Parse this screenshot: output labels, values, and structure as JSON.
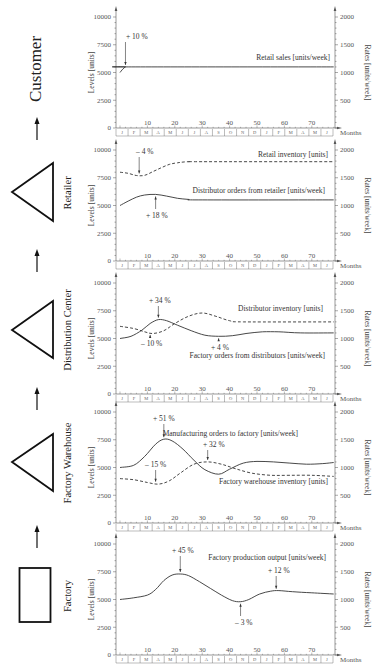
{
  "stages": [
    {
      "name": "Customer",
      "shape": "none"
    },
    {
      "name": "Retailer",
      "shape": "triangle"
    },
    {
      "name": "Distribution Center",
      "shape": "triangle"
    },
    {
      "name": "Factory Warehouse",
      "shape": "triangle"
    },
    {
      "name": "Factory",
      "shape": "rectangle"
    }
  ],
  "axes": {
    "left_title": "Levels  [units]",
    "right_title": "Rates  [units/week]",
    "x_title": "Months",
    "left_ticks": [
      0,
      2500,
      5000,
      7500,
      10000
    ],
    "right_ticks": [
      500,
      1000,
      1500,
      2000
    ],
    "x_ticks": [
      10,
      20,
      30,
      40,
      50,
      60,
      70
    ],
    "month_letters": [
      "J",
      "F",
      "M",
      "A",
      "M",
      "J",
      "J",
      "A",
      "S",
      "O",
      "N",
      "D",
      "J",
      "F",
      "M",
      "A",
      "M",
      "J"
    ]
  },
  "chart_data": [
    {
      "type": "line",
      "panel": "Customer",
      "xlabel": "Months",
      "ylabel_left": "Levels [units]",
      "ylabel_right": "Rates [units/week]",
      "ylim_left": [
        0,
        10000
      ],
      "ylim_right": [
        0,
        2000
      ],
      "xlim": [
        0,
        78
      ],
      "series": [
        {
          "name": "Retail sales [units/week]",
          "axis": "right",
          "style": "solid",
          "x": [
            0,
            1,
            2,
            3,
            78
          ],
          "values": [
            1000,
            1060,
            1100,
            1100,
            1100
          ]
        }
      ],
      "annotations": [
        {
          "text": "+ 10 %",
          "x": 2,
          "y_rate": 1100,
          "label_pos": [
            126,
            39
          ]
        }
      ],
      "label_positions": {
        "Retail sales [units/week]": [
          330,
          60
        ]
      }
    },
    {
      "type": "line",
      "panel": "Retailer",
      "ylim_left": [
        0,
        10000
      ],
      "ylim_right": [
        0,
        2000
      ],
      "xlim": [
        0,
        78
      ],
      "series": [
        {
          "name": "Retail inventory  [units]",
          "axis": "left",
          "style": "dashed",
          "x": [
            0,
            3,
            6,
            9,
            12,
            15,
            18,
            21,
            25,
            30,
            78
          ],
          "values": [
            8000,
            7900,
            7700,
            7720,
            8050,
            8400,
            8700,
            8850,
            8950,
            8950,
            8950
          ]
        },
        {
          "name": "Distributor orders from retailer [units/week]",
          "axis": "right",
          "style": "solid",
          "x": [
            0,
            3,
            6,
            9,
            13,
            17,
            21,
            25,
            30,
            78
          ],
          "values": [
            1000,
            1080,
            1150,
            1190,
            1200,
            1170,
            1130,
            1110,
            1100,
            1100
          ]
        }
      ],
      "annotations": [
        {
          "text": "– 4 %",
          "x": 7,
          "label_pos": [
            136,
            154
          ]
        },
        {
          "text": "+ 18 %",
          "x": 13,
          "label_pos": [
            146,
            218
          ]
        }
      ],
      "label_positions": {
        "Retail inventory  [units]": [
          328,
          157
        ],
        "Distributor orders from retailer [units/week]": [
          325,
          193
        ]
      }
    },
    {
      "type": "line",
      "panel": "Distribution Center",
      "ylim_left": [
        0,
        10000
      ],
      "ylim_right": [
        0,
        2000
      ],
      "xlim": [
        0,
        78
      ],
      "series": [
        {
          "name": "Distributor inventory  [units]",
          "axis": "left",
          "style": "dashed",
          "x": [
            0,
            5,
            9,
            12,
            16,
            20,
            25,
            30,
            35,
            40,
            45,
            78
          ],
          "values": [
            6100,
            5900,
            5600,
            5450,
            5700,
            6350,
            7000,
            7300,
            7000,
            6600,
            6500,
            6500
          ]
        },
        {
          "name": "Factory orders from distributors [units/week]",
          "axis": "right",
          "style": "solid",
          "x": [
            0,
            4,
            8,
            11,
            14,
            17,
            21,
            26,
            31,
            36,
            41,
            46,
            52,
            58,
            66,
            78
          ],
          "values": [
            1000,
            1040,
            1150,
            1270,
            1340,
            1320,
            1240,
            1140,
            1060,
            1040,
            1050,
            1090,
            1120,
            1120,
            1100,
            1100
          ]
        }
      ],
      "annotations": [
        {
          "text": "+ 34 %",
          "x": 14,
          "label_pos": [
            149,
            303
          ]
        },
        {
          "text": "– 10 %",
          "x": 11,
          "label_pos": [
            141,
            346
          ]
        },
        {
          "text": "+ 4 %",
          "x": 36,
          "label_pos": [
            211,
            350
          ]
        }
      ],
      "label_positions": {
        "Distributor inventory  [units]": [
          323,
          311
        ],
        "Factory orders from distributors [units/week]": [
          325,
          358
        ]
      }
    },
    {
      "type": "line",
      "panel": "Factory Warehouse",
      "ylim_left": [
        0,
        10000
      ],
      "ylim_right": [
        0,
        2000
      ],
      "xlim": [
        0,
        78
      ],
      "series": [
        {
          "name": "Manufacturing orders to factory [units/week]",
          "axis": "right",
          "style": "solid",
          "x": [
            0,
            5,
            9,
            13,
            16,
            19,
            23,
            27,
            31,
            36,
            40,
            45,
            50,
            56,
            62,
            68,
            74,
            78
          ],
          "values": [
            1000,
            1040,
            1200,
            1420,
            1510,
            1480,
            1330,
            1130,
            960,
            880,
            970,
            1080,
            1110,
            1100,
            1080,
            1060,
            1070,
            1090
          ]
        },
        {
          "name": "Factory warehouse inventory  [units]",
          "axis": "left",
          "style": "dashed",
          "x": [
            0,
            5,
            10,
            14,
            18,
            22,
            27,
            32,
            37,
            42,
            48,
            55,
            62,
            70,
            78
          ],
          "values": [
            4000,
            3900,
            3650,
            3500,
            3800,
            4500,
            5300,
            5500,
            5300,
            4900,
            4500,
            4300,
            4300,
            4300,
            4200
          ]
        }
      ],
      "annotations": [
        {
          "text": "+ 51 %",
          "x": 16,
          "label_pos": [
            153,
            421
          ]
        },
        {
          "text": "+ 32 %",
          "x": 32,
          "label_pos": [
            203,
            447
          ]
        },
        {
          "text": "– 15 %",
          "x": 13,
          "label_pos": [
            145,
            467
          ]
        }
      ],
      "label_positions": {
        "Manufacturing orders to factory [units/week]": [
          298,
          436
        ],
        "Factory warehouse inventory  [units]": [
          328,
          484
        ]
      }
    },
    {
      "type": "line",
      "panel": "Factory",
      "ylim_left": [
        0,
        10000
      ],
      "ylim_right": [
        0,
        2000
      ],
      "xlim": [
        0,
        78
      ],
      "series": [
        {
          "name": "Factory production output [units/week]",
          "axis": "right",
          "style": "solid",
          "x": [
            0,
            5,
            10,
            13,
            16,
            19,
            22,
            25,
            29,
            33,
            37,
            41,
            44,
            47,
            51,
            55,
            58,
            63,
            70,
            78
          ],
          "values": [
            1000,
            1030,
            1080,
            1180,
            1340,
            1440,
            1460,
            1430,
            1320,
            1200,
            1080,
            980,
            960,
            1000,
            1100,
            1150,
            1160,
            1140,
            1120,
            1100
          ]
        }
      ],
      "annotations": [
        {
          "text": "+ 45 %",
          "x": 22,
          "label_pos": [
            172,
            553
          ]
        },
        {
          "text": "+ 12 %",
          "x": 57,
          "label_pos": [
            268,
            573
          ]
        },
        {
          "text": "– 3 %",
          "x": 44,
          "label_pos": [
            235,
            625
          ]
        }
      ],
      "label_positions": {
        "Factory production output [units/week]": [
          326,
          560
        ]
      }
    }
  ],
  "colors": {
    "line": "#333333",
    "axis": "#555555",
    "shape_stroke": "#111111",
    "background": "#ffffff"
  }
}
